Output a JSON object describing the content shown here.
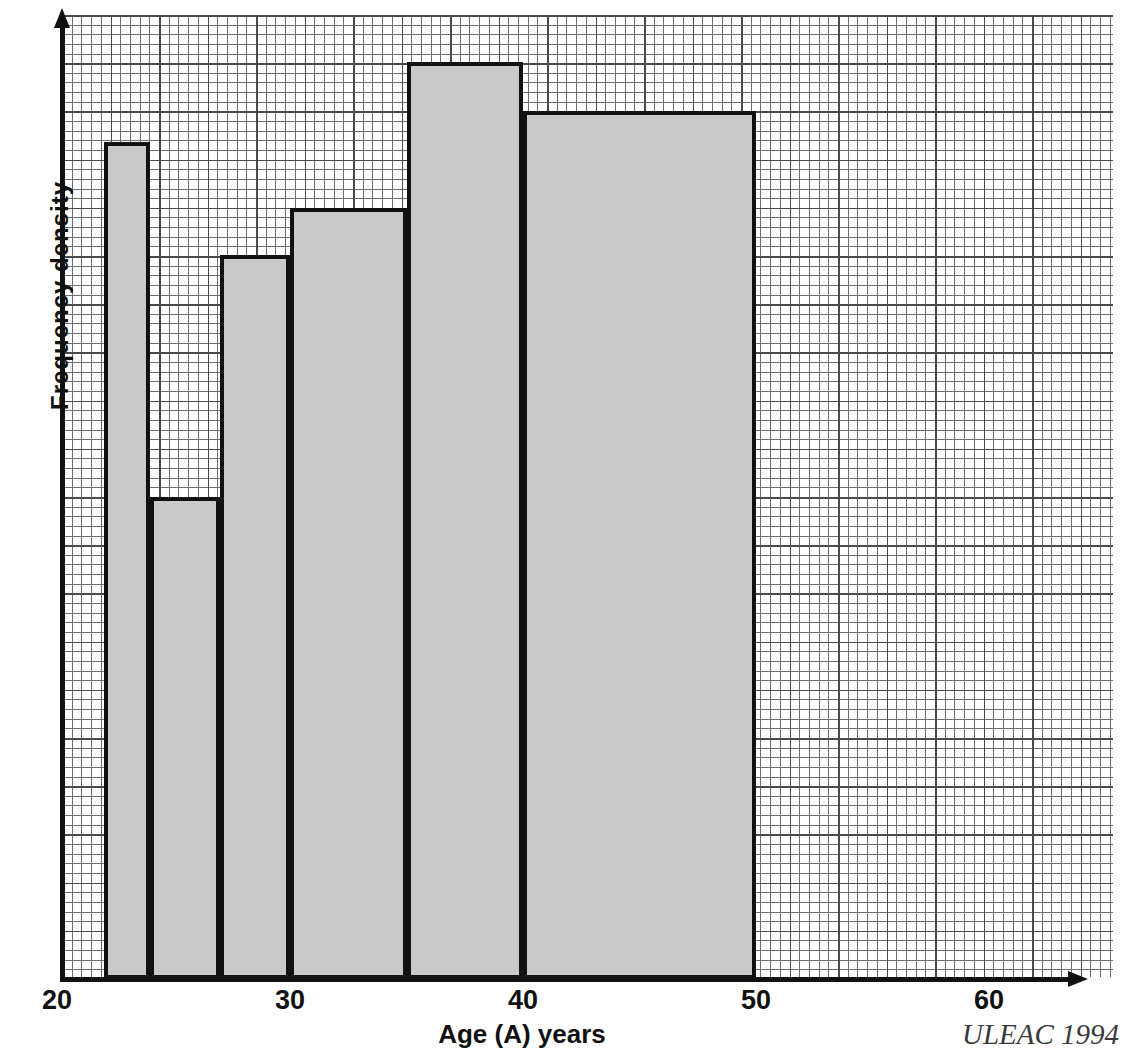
{
  "figure": {
    "y_axis_label": "Frequency density",
    "x_axis_label": "Age (A) years",
    "credit": "ULEAC 1994"
  },
  "axis": {
    "x_ticks": [
      {
        "label": "20",
        "value": 20
      },
      {
        "label": "30",
        "value": 30
      },
      {
        "label": "40",
        "value": 40
      },
      {
        "label": "50",
        "value": 50
      },
      {
        "label": "60",
        "value": 60
      }
    ]
  },
  "chart_data": {
    "type": "bar",
    "title": "",
    "xlabel": "Age (A) years",
    "ylabel": "Frequency density",
    "xlim": [
      20,
      64
    ],
    "ylim": [
      0,
      1
    ],
    "grid": "graph-paper minor 0.2 major 1.0 units",
    "legend": "none",
    "note": "Histogram with unequal class widths; bar heights are frequency density (y-axis unlabelled numerically).",
    "bins": [
      {
        "label": "22-24",
        "x_start": 22,
        "x_end": 24,
        "density": 0.866
      },
      {
        "label": "24-27",
        "x_start": 24,
        "x_end": 27,
        "density": 0.498
      },
      {
        "label": "27-30",
        "x_start": 27,
        "x_end": 30,
        "density": 0.749
      },
      {
        "label": "30-35",
        "x_start": 30,
        "x_end": 35,
        "density": 0.798
      },
      {
        "label": "35-40",
        "x_start": 35,
        "x_end": 40,
        "density": 0.949
      },
      {
        "label": "40-50",
        "x_start": 40,
        "x_end": 50,
        "density": 0.898
      }
    ],
    "categories": [
      "22-24",
      "24-27",
      "27-30",
      "30-35",
      "35-40",
      "40-50"
    ],
    "values": [
      0.866,
      0.498,
      0.749,
      0.798,
      0.949,
      0.898
    ]
  }
}
